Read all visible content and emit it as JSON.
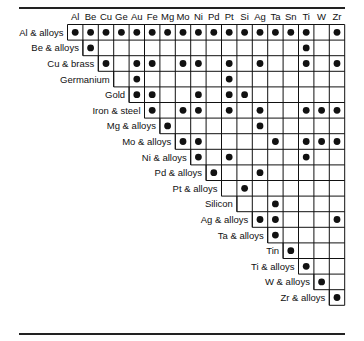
{
  "chart_data": {
    "type": "table",
    "title": "",
    "columns": [
      "Al",
      "Be",
      "Cu",
      "Ge",
      "Au",
      "Fe",
      "Mg",
      "Mo",
      "Ni",
      "Pd",
      "Pt",
      "Si",
      "Ag",
      "Ta",
      "Sn",
      "Ti",
      "W",
      "Zr"
    ],
    "rows": [
      {
        "label": "Al & alloys",
        "start": "Al",
        "marks": [
          "Al",
          "Be",
          "Cu",
          "Ge",
          "Au",
          "Fe",
          "Mg",
          "Mo",
          "Ni",
          "Pd",
          "Pt",
          "Si",
          "Ag",
          "Ta",
          "Sn",
          "Ti",
          "Zr"
        ]
      },
      {
        "label": "Be & alloys",
        "start": "Be",
        "marks": [
          "Be",
          "Ti"
        ]
      },
      {
        "label": "Cu & brass",
        "start": "Cu",
        "marks": [
          "Cu",
          "Au",
          "Fe",
          "Mo",
          "Ni",
          "Pt",
          "Ag",
          "Ti",
          "Zr"
        ]
      },
      {
        "label": "Germanium",
        "start": "Ge",
        "marks": [
          "Au",
          "Pt"
        ]
      },
      {
        "label": "Gold",
        "start": "Au",
        "marks": [
          "Au",
          "Fe",
          "Ni",
          "Pt",
          "Si"
        ]
      },
      {
        "label": "Iron & steel",
        "start": "Fe",
        "marks": [
          "Fe",
          "Mo",
          "Ni",
          "Pt",
          "Ag",
          "Ti",
          "W",
          "Zr"
        ]
      },
      {
        "label": "Mg & alloys",
        "start": "Mg",
        "marks": [
          "Mg",
          "Ag"
        ]
      },
      {
        "label": "Mo & alloys",
        "start": "Mo",
        "marks": [
          "Mo",
          "Ni",
          "Ta",
          "Ti",
          "W",
          "Zr"
        ]
      },
      {
        "label": "Ni & alloys",
        "start": "Ni",
        "marks": [
          "Ni",
          "Pt",
          "Ti"
        ]
      },
      {
        "label": "Pd & alloys",
        "start": "Pd",
        "marks": [
          "Pd",
          "Ag"
        ]
      },
      {
        "label": "Pt & alloys",
        "start": "Pt",
        "marks": [
          "Si"
        ]
      },
      {
        "label": "Silicon",
        "start": "Si",
        "marks": [
          "Ta"
        ]
      },
      {
        "label": "Ag & alloys",
        "start": "Ag",
        "marks": [
          "Ag",
          "Ta",
          "Zr"
        ]
      },
      {
        "label": "Ta & alloys",
        "start": "Ta",
        "marks": [
          "Ta"
        ]
      },
      {
        "label": "Tin",
        "start": "Sn",
        "marks": [
          "Sn"
        ]
      },
      {
        "label": "Ti & alloys",
        "start": "Ti",
        "marks": [
          "Ti"
        ]
      },
      {
        "label": "W & alloys",
        "start": "W",
        "marks": [
          "W"
        ]
      },
      {
        "label": "Zr & alloys",
        "start": "Zr",
        "marks": [
          "Zr"
        ]
      }
    ],
    "mark_symbol": "filled-circle",
    "colors": {
      "ink": "#111111",
      "background": "#ffffff"
    }
  }
}
